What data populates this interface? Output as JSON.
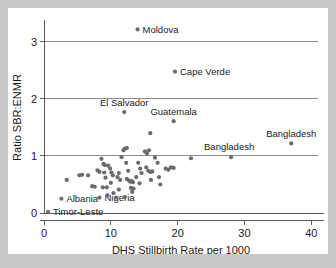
{
  "figure": {
    "background_color": "#c9c9c9",
    "panel_color": "#ffffff",
    "marker_color": "#6b6b6b",
    "grid_color": "#8c8c8c",
    "axis_color": "#5a5a5a"
  },
  "chart_data": {
    "type": "scatter",
    "title": "",
    "xlabel": "DHS Stillbirth Rate per 1000",
    "ylabel": "Ratio SBR:ENMR",
    "xlim": [
      0,
      41
    ],
    "ylim": [
      0,
      3.35
    ],
    "xticks": [
      0,
      10,
      20,
      30,
      40
    ],
    "xticklabels": [
      "0",
      "10",
      "20",
      "30",
      "40"
    ],
    "yticks": [
      0,
      1,
      2,
      3
    ],
    "yticklabels": [
      "0",
      "1",
      "2",
      "3"
    ],
    "grid": "horizontal",
    "gridlines_y": [
      1,
      2,
      3
    ],
    "legend": "none",
    "points": [
      {
        "x": 14.0,
        "y": 3.22,
        "label": "Moldova",
        "label_pos": "right"
      },
      {
        "x": 19.6,
        "y": 2.48,
        "label": "Cape Verde",
        "label_pos": "right"
      },
      {
        "x": 12.0,
        "y": 1.77,
        "label": "El Salvador",
        "label_pos": "above"
      },
      {
        "x": 19.4,
        "y": 1.61,
        "label": "Guatemala",
        "label_pos": "above"
      },
      {
        "x": 37.0,
        "y": 1.22,
        "label": "Bangladesh",
        "label_pos": "above"
      },
      {
        "x": 28.0,
        "y": 0.98,
        "label": "Bangladesh",
        "label_pos": "above-left"
      },
      {
        "x": 2.6,
        "y": 0.25,
        "label": "Albania",
        "label_pos": "right"
      },
      {
        "x": 8.3,
        "y": 0.27,
        "label": "Nigeria",
        "label_pos": "right"
      },
      {
        "x": 0.6,
        "y": 0.02,
        "label": "Timor-Leste",
        "label_pos": "right"
      },
      {
        "x": 15.9,
        "y": 1.4,
        "label": "",
        "label_pos": ""
      },
      {
        "x": 3.4,
        "y": 0.58,
        "label": "",
        "label_pos": ""
      },
      {
        "x": 5.3,
        "y": 0.66,
        "label": "",
        "label_pos": ""
      },
      {
        "x": 5.7,
        "y": 0.67,
        "label": "",
        "label_pos": ""
      },
      {
        "x": 6.6,
        "y": 0.66,
        "label": "",
        "label_pos": ""
      },
      {
        "x": 7.2,
        "y": 0.47,
        "label": "",
        "label_pos": ""
      },
      {
        "x": 7.6,
        "y": 0.46,
        "label": "",
        "label_pos": ""
      },
      {
        "x": 8.0,
        "y": 0.75,
        "label": "",
        "label_pos": ""
      },
      {
        "x": 8.3,
        "y": 0.72,
        "label": "",
        "label_pos": ""
      },
      {
        "x": 8.6,
        "y": 0.95,
        "label": "",
        "label_pos": ""
      },
      {
        "x": 8.9,
        "y": 0.86,
        "label": "",
        "label_pos": ""
      },
      {
        "x": 9.1,
        "y": 0.84,
        "label": "",
        "label_pos": ""
      },
      {
        "x": 9.0,
        "y": 0.71,
        "label": "",
        "label_pos": ""
      },
      {
        "x": 9.2,
        "y": 0.62,
        "label": "",
        "label_pos": ""
      },
      {
        "x": 8.8,
        "y": 0.45,
        "label": "",
        "label_pos": ""
      },
      {
        "x": 9.4,
        "y": 0.45,
        "label": "",
        "label_pos": ""
      },
      {
        "x": 9.6,
        "y": 0.83,
        "label": "",
        "label_pos": ""
      },
      {
        "x": 9.9,
        "y": 0.78,
        "label": "",
        "label_pos": ""
      },
      {
        "x": 10.1,
        "y": 0.71,
        "label": "",
        "label_pos": ""
      },
      {
        "x": 10.3,
        "y": 0.66,
        "label": "",
        "label_pos": ""
      },
      {
        "x": 10.0,
        "y": 0.53,
        "label": "",
        "label_pos": ""
      },
      {
        "x": 10.4,
        "y": 0.35,
        "label": "",
        "label_pos": ""
      },
      {
        "x": 11.0,
        "y": 0.63,
        "label": "",
        "label_pos": ""
      },
      {
        "x": 11.2,
        "y": 0.7,
        "label": "",
        "label_pos": ""
      },
      {
        "x": 11.4,
        "y": 0.58,
        "label": "",
        "label_pos": ""
      },
      {
        "x": 11.2,
        "y": 0.41,
        "label": "",
        "label_pos": ""
      },
      {
        "x": 11.6,
        "y": 0.98,
        "label": "",
        "label_pos": ""
      },
      {
        "x": 11.9,
        "y": 1.1,
        "label": "",
        "label_pos": ""
      },
      {
        "x": 12.1,
        "y": 1.13,
        "label": "",
        "label_pos": ""
      },
      {
        "x": 12.4,
        "y": 1.14,
        "label": "",
        "label_pos": ""
      },
      {
        "x": 12.3,
        "y": 0.88,
        "label": "",
        "label_pos": ""
      },
      {
        "x": 12.6,
        "y": 0.74,
        "label": "",
        "label_pos": ""
      },
      {
        "x": 12.4,
        "y": 0.6,
        "label": "",
        "label_pos": ""
      },
      {
        "x": 12.7,
        "y": 0.57,
        "label": "",
        "label_pos": ""
      },
      {
        "x": 12.9,
        "y": 0.55,
        "label": "",
        "label_pos": ""
      },
      {
        "x": 13.1,
        "y": 0.56,
        "label": "",
        "label_pos": ""
      },
      {
        "x": 13.3,
        "y": 0.54,
        "label": "",
        "label_pos": ""
      },
      {
        "x": 13.0,
        "y": 0.44,
        "label": "",
        "label_pos": ""
      },
      {
        "x": 13.4,
        "y": 0.43,
        "label": "",
        "label_pos": ""
      },
      {
        "x": 13.2,
        "y": 0.37,
        "label": "",
        "label_pos": ""
      },
      {
        "x": 13.8,
        "y": 0.63,
        "label": "",
        "label_pos": ""
      },
      {
        "x": 14.1,
        "y": 0.88,
        "label": "",
        "label_pos": ""
      },
      {
        "x": 14.4,
        "y": 0.78,
        "label": "",
        "label_pos": ""
      },
      {
        "x": 14.6,
        "y": 0.7,
        "label": "",
        "label_pos": ""
      },
      {
        "x": 14.3,
        "y": 0.52,
        "label": "",
        "label_pos": ""
      },
      {
        "x": 15.1,
        "y": 1.08,
        "label": "",
        "label_pos": ""
      },
      {
        "x": 15.4,
        "y": 1.05,
        "label": "",
        "label_pos": ""
      },
      {
        "x": 15.7,
        "y": 1.1,
        "label": "",
        "label_pos": ""
      },
      {
        "x": 15.3,
        "y": 0.8,
        "label": "",
        "label_pos": ""
      },
      {
        "x": 15.6,
        "y": 0.74,
        "label": "",
        "label_pos": ""
      },
      {
        "x": 15.9,
        "y": 0.72,
        "label": "",
        "label_pos": ""
      },
      {
        "x": 16.2,
        "y": 0.73,
        "label": "",
        "label_pos": ""
      },
      {
        "x": 16.0,
        "y": 0.58,
        "label": "",
        "label_pos": ""
      },
      {
        "x": 16.6,
        "y": 0.97,
        "label": "",
        "label_pos": ""
      },
      {
        "x": 17.0,
        "y": 0.88,
        "label": "",
        "label_pos": ""
      },
      {
        "x": 17.2,
        "y": 0.63,
        "label": "",
        "label_pos": ""
      },
      {
        "x": 17.4,
        "y": 0.5,
        "label": "",
        "label_pos": ""
      },
      {
        "x": 18.2,
        "y": 0.78,
        "label": "",
        "label_pos": ""
      },
      {
        "x": 18.6,
        "y": 0.76,
        "label": "",
        "label_pos": ""
      },
      {
        "x": 19.0,
        "y": 0.8,
        "label": "",
        "label_pos": ""
      },
      {
        "x": 19.4,
        "y": 0.79,
        "label": "",
        "label_pos": ""
      },
      {
        "x": 22.0,
        "y": 0.96,
        "label": "",
        "label_pos": ""
      },
      {
        "x": 10.8,
        "y": 0.27,
        "label": "",
        "label_pos": ""
      },
      {
        "x": 12.1,
        "y": 0.28,
        "label": "",
        "label_pos": ""
      },
      {
        "x": 9.5,
        "y": 0.31,
        "label": "",
        "label_pos": ""
      }
    ]
  }
}
